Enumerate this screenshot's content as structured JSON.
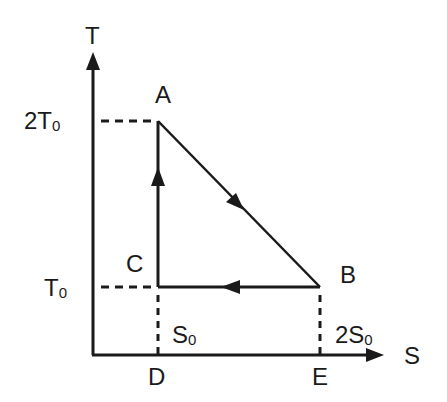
{
  "diagram": {
    "type": "T-S cycle diagram",
    "axes": {
      "y_label": "T",
      "x_label": "S",
      "y_ticks": [
        {
          "base": "2T",
          "sub": "0"
        },
        {
          "base": "T",
          "sub": "0"
        }
      ],
      "x_ticks": [
        {
          "base": "S",
          "sub": "0"
        },
        {
          "base": "2S",
          "sub": "0"
        }
      ]
    },
    "points": {
      "A": "A",
      "B": "B",
      "C": "C",
      "D": "D",
      "E": "E"
    },
    "cycle": [
      "C→A (upward)",
      "A→B (diagonal down)",
      "B→C (leftward)"
    ],
    "colors": {
      "line": "#1a1a1a",
      "background": "#ffffff"
    }
  }
}
